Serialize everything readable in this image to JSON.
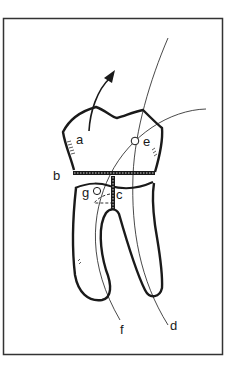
{
  "figure": {
    "type": "tooth-diagram",
    "colors": {
      "stroke": "#1a1a1a",
      "background": "#ffffff",
      "frame": "#333333"
    },
    "labels": {
      "a": "a",
      "b": "b",
      "c": "c",
      "d": "d",
      "e": "e",
      "f": "f",
      "g": "g"
    }
  }
}
